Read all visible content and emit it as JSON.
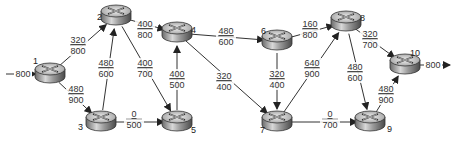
{
  "diagram": {
    "type": "flow-network",
    "source_input": {
      "label": "800",
      "node": "1"
    },
    "sink_output": {
      "label": "800",
      "node": "10"
    },
    "nodes": [
      {
        "id": "1",
        "x": 50,
        "y": 74,
        "label_x": 33,
        "label_y": 64
      },
      {
        "id": "2",
        "x": 116,
        "y": 16,
        "label_x": 97,
        "label_y": 20
      },
      {
        "id": "3",
        "x": 101,
        "y": 122,
        "label_x": 78,
        "label_y": 130
      },
      {
        "id": "4",
        "x": 177,
        "y": 33,
        "label_x": 191,
        "label_y": 33
      },
      {
        "id": "5",
        "x": 177,
        "y": 122,
        "label_x": 191,
        "label_y": 133
      },
      {
        "id": "6",
        "x": 277,
        "y": 41,
        "label_x": 261,
        "label_y": 34
      },
      {
        "id": "7",
        "x": 277,
        "y": 122,
        "label_x": 260,
        "label_y": 133
      },
      {
        "id": "8",
        "x": 346,
        "y": 22,
        "label_x": 360,
        "label_y": 21
      },
      {
        "id": "9",
        "x": 370,
        "y": 122,
        "label_x": 387,
        "label_y": 132
      },
      {
        "id": "10",
        "x": 405,
        "y": 65,
        "label_x": 410,
        "label_y": 56
      }
    ],
    "edges": [
      {
        "from": "1",
        "to": "2",
        "flow": "320",
        "capacity": "800",
        "lx": 78,
        "ly": 44
      },
      {
        "from": "1",
        "to": "3",
        "flow": "480",
        "capacity": "900",
        "lx": 76,
        "ly": 93
      },
      {
        "from": "3",
        "to": "2",
        "flow": "480",
        "capacity": "600",
        "lx": 106,
        "ly": 67
      },
      {
        "from": "2",
        "to": "4",
        "flow": "400",
        "capacity": "800",
        "lx": 145,
        "ly": 28
      },
      {
        "from": "2",
        "to": "5",
        "flow": "400",
        "capacity": "700",
        "lx": 145,
        "ly": 67
      },
      {
        "from": "3",
        "to": "5",
        "flow": "0",
        "capacity": "500",
        "lx": 134,
        "ly": 118
      },
      {
        "from": "5",
        "to": "4",
        "flow": "400",
        "capacity": "500",
        "lx": 177,
        "ly": 78
      },
      {
        "from": "4",
        "to": "6",
        "flow": "480",
        "capacity": "600",
        "lx": 226,
        "ly": 35
      },
      {
        "from": "4",
        "to": "7",
        "flow": "320",
        "capacity": "400",
        "lx": 224,
        "ly": 80
      },
      {
        "from": "6",
        "to": "7",
        "flow": "320",
        "capacity": "400",
        "lx": 277,
        "ly": 78
      },
      {
        "from": "6",
        "to": "8",
        "flow": "160",
        "capacity": "800",
        "lx": 310,
        "ly": 28
      },
      {
        "from": "7",
        "to": "8",
        "flow": "640",
        "capacity": "900",
        "lx": 312,
        "ly": 67
      },
      {
        "from": "7",
        "to": "9",
        "flow": "0",
        "capacity": "700",
        "lx": 330,
        "ly": 118
      },
      {
        "from": "8",
        "to": "10",
        "flow": "320",
        "capacity": "700",
        "lx": 370,
        "ly": 38
      },
      {
        "from": "8",
        "to": "9",
        "flow": "480",
        "capacity": "600",
        "lx": 355,
        "ly": 71
      },
      {
        "from": "9",
        "to": "10",
        "flow": "480",
        "capacity": "900",
        "lx": 386,
        "ly": 93
      }
    ]
  }
}
